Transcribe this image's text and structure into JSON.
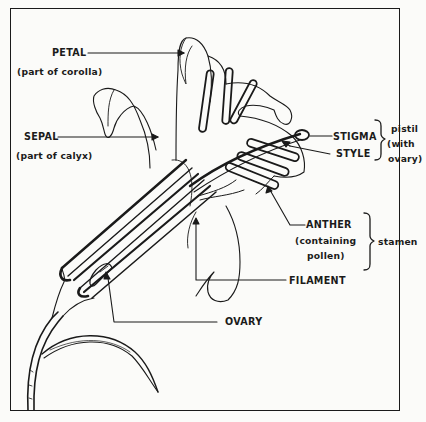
{
  "diagram": {
    "labels": {
      "petal": "PETAL",
      "petal_note": "(part of corolla)",
      "sepal": "SEPAL",
      "sepal_note": "(part of calyx)",
      "stigma": "STIGMA",
      "style": "STYLE",
      "pistil_group": "pistil",
      "pistil_note_1": "(with",
      "pistil_note_2": "ovary)",
      "anther": "ANTHER",
      "anther_note_1": "(containing",
      "anther_note_2": "pollen)",
      "stamen_group": "stamen",
      "filament": "FILAMENT",
      "ovary": "OVARY"
    },
    "groups": [
      {
        "name": "pistil",
        "members": [
          "STIGMA",
          "STYLE",
          "OVARY"
        ]
      },
      {
        "name": "stamen",
        "members": [
          "ANTHER",
          "FILAMENT"
        ]
      }
    ],
    "colors": {
      "ink": "#1a1a1a",
      "paper": "#fbfbf9",
      "bleed_text": "#e9e9e6"
    }
  }
}
